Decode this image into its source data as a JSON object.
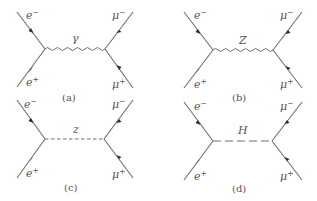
{
  "figure": {
    "diagrams": [
      {
        "id": "a",
        "caption": "(a)",
        "propagator": {
          "label": "γ",
          "style": "wavy",
          "name": "photon"
        },
        "particles": {
          "in_top": {
            "base": "e",
            "charge": "−"
          },
          "in_bottom": {
            "base": "e",
            "charge": "+"
          },
          "out_top": {
            "base": "μ",
            "charge": "−"
          },
          "out_bottom": {
            "base": "μ",
            "charge": "+"
          }
        }
      },
      {
        "id": "b",
        "caption": "(b)",
        "propagator": {
          "label": "Z",
          "style": "wavy",
          "name": "Z boson"
        },
        "particles": {
          "in_top": {
            "base": "e",
            "charge": "−"
          },
          "in_bottom": {
            "base": "e",
            "charge": "+"
          },
          "out_top": {
            "base": "μ",
            "charge": "−"
          },
          "out_bottom": {
            "base": "μ",
            "charge": "+"
          }
        }
      },
      {
        "id": "c",
        "caption": "(c)",
        "propagator": {
          "label": "z",
          "style": "dashed",
          "name": "scalar z"
        },
        "particles": {
          "in_top": {
            "base": "e",
            "charge": "−"
          },
          "in_bottom": {
            "base": "e",
            "charge": "+"
          },
          "out_top": {
            "base": "μ",
            "charge": "−"
          },
          "out_bottom": {
            "base": "μ",
            "charge": "+"
          }
        }
      },
      {
        "id": "d",
        "caption": "(d)",
        "propagator": {
          "label": "H",
          "style": "long-dashed",
          "name": "Higgs"
        },
        "particles": {
          "in_top": {
            "base": "e",
            "charge": "−"
          },
          "in_bottom": {
            "base": "e",
            "charge": "+"
          },
          "out_top": {
            "base": "μ",
            "charge": "−"
          },
          "out_bottom": {
            "base": "μ",
            "charge": "+"
          }
        }
      }
    ]
  }
}
